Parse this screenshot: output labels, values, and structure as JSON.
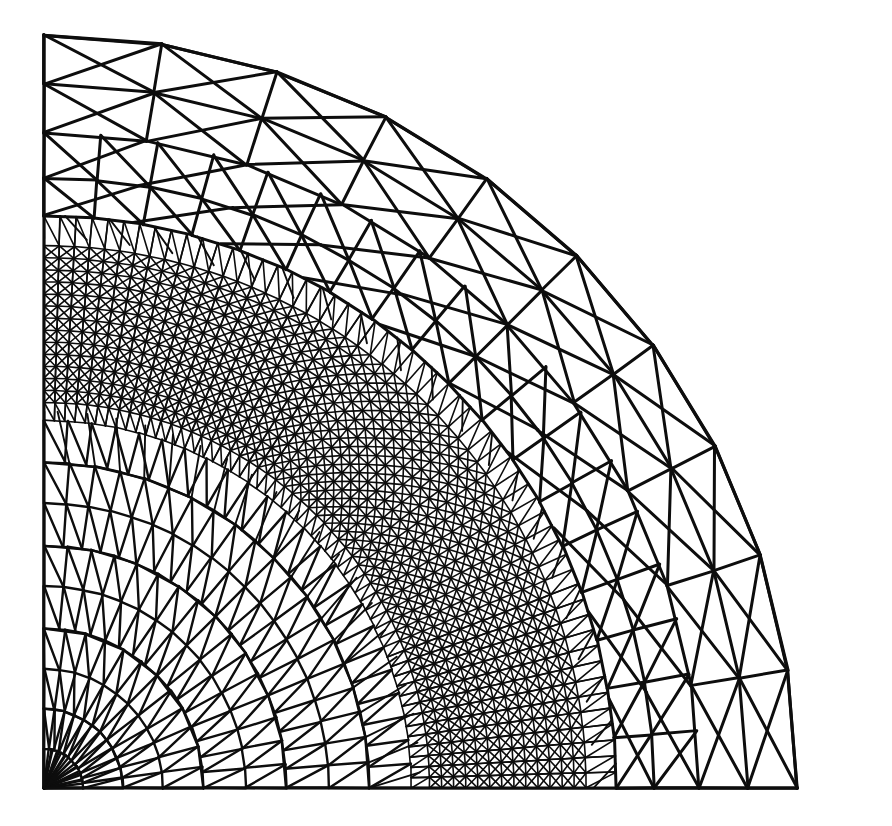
{
  "figure": {
    "kind": "finite-element-mesh",
    "caption": "",
    "background_color": "#ffffff",
    "line_color": "#0d0d0d",
    "line_width_coarse": 3.0,
    "line_width_medium": 2.4,
    "line_width_fine": 1.9,
    "line_width_ultrafine": 1.6
  },
  "geometry": {
    "domain_shape": "quarter-disc",
    "origin_x": 44,
    "origin_y": 788,
    "radius_px": 753,
    "angle_start_deg": 0,
    "angle_end_deg": 90,
    "bounding_box": {
      "x": 44,
      "y": 35,
      "width": 812,
      "height": 753
    },
    "corner_bottom_left": [
      44,
      788
    ],
    "corner_bottom_right": [
      856,
      788
    ],
    "corner_top_left": [
      44,
      35
    ],
    "outer_arc_is_polygonal": true
  },
  "mesh_spec": {
    "radial_rings": [
      0.0,
      0.052,
      0.105,
      0.158,
      0.212,
      0.268,
      0.322,
      0.378,
      0.432,
      0.488,
      0.512,
      0.528,
      0.544,
      0.56,
      0.576,
      0.592,
      0.608,
      0.624,
      0.64,
      0.656,
      0.672,
      0.688,
      0.704,
      0.72,
      0.76,
      0.81,
      0.87,
      0.935,
      1.0
    ],
    "refined_band_inner_fraction": 0.5,
    "refined_band_outer_fraction": 0.73,
    "angular_divisions_core": 12,
    "angular_divisions_mid": 24,
    "angular_divisions_refined": 56,
    "angular_divisions_outer": 10,
    "diagonal_direction": "ccw",
    "refinement_type": "anisotropic-annular"
  },
  "chart_data": {
    "type": "mesh",
    "xlabel": "",
    "ylabel": "",
    "regions": [
      {
        "name": "inner core",
        "radius_fraction": [
          0.0,
          0.5
        ],
        "element_size": "coarse-to-medium",
        "density": "low"
      },
      {
        "name": "refined annular band",
        "radius_fraction": [
          0.5,
          0.73
        ],
        "element_size": "very fine",
        "density": "very high"
      },
      {
        "name": "outer ring",
        "radius_fraction": [
          0.73,
          1.0
        ],
        "element_size": "coarse",
        "density": "low"
      }
    ],
    "boundaries": [
      {
        "name": "left straight edge",
        "from": [
          44,
          788
        ],
        "to": [
          44,
          35
        ]
      },
      {
        "name": "bottom straight edge",
        "from": [
          44,
          788
        ],
        "to": [
          856,
          788
        ]
      },
      {
        "name": "outer circular arc",
        "from": [
          44,
          35
        ],
        "to": [
          856,
          788
        ],
        "center": [
          44,
          788
        ],
        "radius": 753
      }
    ]
  }
}
